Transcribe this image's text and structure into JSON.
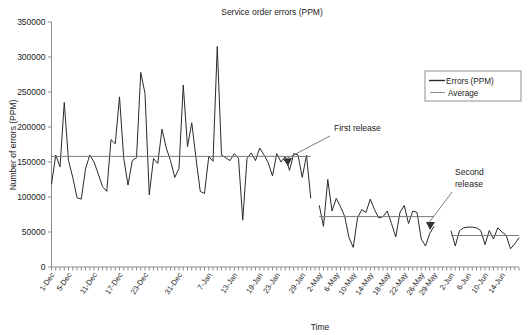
{
  "chart_data": {
    "type": "line",
    "title": "Service order errors (PPM)",
    "xlabel": "Time",
    "ylabel": "Number of errors (PPM)",
    "ylim": [
      0,
      350000
    ],
    "ytick_values": [
      0,
      50000,
      100000,
      150000,
      200000,
      250000,
      300000,
      350000
    ],
    "ytick_labels": [
      "0",
      "50000",
      "100000",
      "150000",
      "200000",
      "250000",
      "300000",
      "350000"
    ],
    "grid": false,
    "legend_position": "top-right",
    "legend": [
      "Errors (PPM)",
      "Average"
    ],
    "xtick_labels": [
      "1-Dec",
      "5-Dec",
      "11-Dec",
      "17-Dec",
      "23-Dec",
      "31-Dec",
      "7-Jan",
      "13-Jan",
      "19-Jan",
      "23-Jan",
      "29-Jan",
      "2-May",
      "6-May",
      "10-May",
      "14-May",
      "18-May",
      "22-May",
      "26-May",
      "29-May",
      "2-Jun",
      "6-Jun",
      "10-Jun",
      "14-Jun"
    ],
    "xtick_label_indices": [
      0,
      4,
      10,
      16,
      22,
      30,
      37,
      43,
      49,
      53,
      59,
      63,
      67,
      71,
      75,
      79,
      83,
      87,
      90,
      94,
      98,
      102,
      106
    ],
    "n_ticks": 111,
    "annotations": [
      {
        "text": "First release",
        "name": "first-release-annotation"
      },
      {
        "text": "Second release",
        "name": "second-release-annotation"
      }
    ],
    "series": [
      {
        "name": "Errors (PPM)",
        "segment": 1,
        "label": "Before first release",
        "x_start_index": 0,
        "x_end_index": 61,
        "values": [
          118000,
          160000,
          143000,
          235000,
          152000,
          128000,
          99000,
          97000,
          140000,
          160000,
          150000,
          133000,
          115000,
          108000,
          182000,
          176000,
          243000,
          155000,
          117000,
          152000,
          156000,
          278000,
          248000,
          103000,
          155000,
          148000,
          197000,
          170000,
          152000,
          128000,
          141000,
          260000,
          172000,
          206000,
          155000,
          108000,
          105000,
          158000,
          151000,
          315000,
          160000,
          156000,
          152000,
          162000,
          155000,
          67000,
          155000,
          163000,
          152000,
          170000,
          160000,
          149000,
          130000,
          162000,
          150000,
          158000,
          138000,
          162000,
          160000,
          128000,
          160000,
          98000
        ]
      },
      {
        "name": "Errors (PPM)",
        "segment": 2,
        "label": "Between first and second release",
        "x_start_index": 63,
        "x_end_index": 90,
        "values": [
          88000,
          58000,
          125000,
          80000,
          98000,
          86000,
          72000,
          42000,
          28000,
          70000,
          82000,
          78000,
          97000,
          82000,
          70000,
          72000,
          80000,
          62000,
          43000,
          78000,
          88000,
          62000,
          80000,
          78000,
          40000,
          30000,
          48000,
          58000
        ]
      },
      {
        "name": "Errors (PPM)",
        "segment": 3,
        "label": "After second release",
        "x_start_index": 94,
        "x_end_index": 110,
        "values": [
          52000,
          30000,
          52000,
          56000,
          57000,
          57000,
          56000,
          52000,
          32000,
          52000,
          40000,
          56000,
          50000,
          45000,
          26000,
          33000,
          42000
        ]
      }
    ],
    "average_lines": [
      {
        "name": "average-segment-1",
        "value": 158000,
        "x_start_index": 0,
        "x_end_index": 61
      },
      {
        "name": "average-segment-2",
        "value": 72000,
        "x_start_index": 63,
        "x_end_index": 90
      },
      {
        "name": "average-segment-3",
        "value": 45000,
        "x_start_index": 94,
        "x_end_index": 110
      }
    ],
    "colors": {
      "series": "#2a2a2a",
      "average": "#7a7a7a",
      "axis": "#8d8d8d",
      "text": "#222222",
      "background": "#ffffff"
    }
  }
}
